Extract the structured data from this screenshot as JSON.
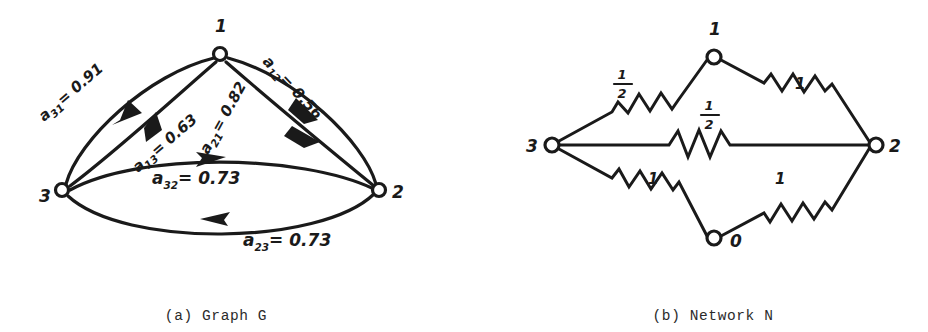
{
  "figure": {
    "panels": [
      {
        "id": "graph-g",
        "caption": "(a) Graph G",
        "nodes": [
          {
            "id": "1",
            "label": "1",
            "x": 220,
            "y": 54
          },
          {
            "id": "3",
            "label": "3",
            "x": 62,
            "y": 190
          },
          {
            "id": "2",
            "label": "2",
            "x": 379,
            "y": 190
          }
        ],
        "edges": [
          {
            "from": "3",
            "to": "1",
            "label_base": "a",
            "label_sub": "31",
            "label_value": "= 0.91",
            "full": "a31 = 0.91"
          },
          {
            "from": "1",
            "to": "3",
            "label_base": "a",
            "label_sub": "13",
            "label_value": "= 0.63",
            "full": "a13 = 0.63"
          },
          {
            "from": "2",
            "to": "1",
            "label_base": "a",
            "label_sub": "21",
            "label_value": "= 0.82",
            "full": "a21 = 0.82"
          },
          {
            "from": "1",
            "to": "2",
            "label_base": "a",
            "label_sub": "12",
            "label_value": "= 0.56",
            "full": "a12 = 0.56"
          },
          {
            "from": "3",
            "to": "2",
            "label_base": "a",
            "label_sub": "32",
            "label_value": "= 0.73",
            "full": "a32 = 0.73"
          },
          {
            "from": "2",
            "to": "3",
            "label_base": "a",
            "label_sub": "23",
            "label_value": "= 0.73",
            "full": "a23 = 0.73"
          }
        ]
      },
      {
        "id": "network-n",
        "caption": "(b) Network N",
        "nodes": [
          {
            "id": "1",
            "label": "1",
            "x": 250,
            "y": 57
          },
          {
            "id": "3",
            "label": "3",
            "x": 88,
            "y": 144
          },
          {
            "id": "2",
            "label": "2",
            "x": 412,
            "y": 144
          },
          {
            "id": "0",
            "label": "0",
            "x": 250,
            "y": 238
          }
        ],
        "resistors": [
          {
            "between": [
              "3",
              "1"
            ],
            "value": "1/2",
            "numerator": "1",
            "denominator": "2",
            "fraction": true
          },
          {
            "between": [
              "1",
              "2"
            ],
            "value": "1",
            "numerator": "1",
            "denominator": "",
            "fraction": false
          },
          {
            "between": [
              "3",
              "2"
            ],
            "value": "1/2",
            "numerator": "1",
            "denominator": "2",
            "fraction": true
          },
          {
            "between": [
              "3",
              "0"
            ],
            "value": "1",
            "numerator": "1",
            "denominator": "",
            "fraction": false
          },
          {
            "between": [
              "0",
              "2"
            ],
            "value": "1",
            "numerator": "1",
            "denominator": "",
            "fraction": false
          }
        ]
      }
    ],
    "colors": {
      "ink": "#1a1a1a",
      "paper": "#ffffff",
      "caption_ink": "#2b2b2b"
    }
  }
}
